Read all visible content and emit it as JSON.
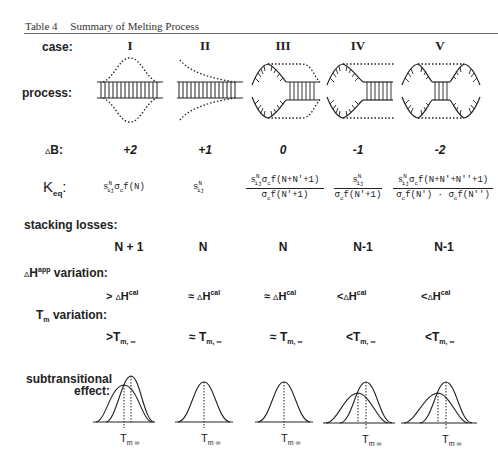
{
  "table": {
    "number": "Table 4",
    "title": "Summary of Melting Process"
  },
  "row_labels": {
    "case": "case:",
    "process": "process:",
    "delta_b": "B:",
    "delta_symbol": "Δ",
    "keq_main": "K",
    "keq_sub": "eq",
    "keq_colon": ":",
    "stacking_losses": "stacking losses:",
    "dh_variation_delta": "Δ",
    "dh_variation_H": "H",
    "dh_variation_sup": "app",
    "dh_variation_rest": " variation:",
    "tm_variation_T": "T",
    "tm_variation_sub": "m",
    "tm_variation_rest": " variation:",
    "subtransitional_line1": "subtransitional",
    "subtransitional_line2": "effect:"
  },
  "cases": [
    {
      "numeral": "I",
      "delta_b": "+2",
      "keq": {
        "type": "simple",
        "text": "s^N_ij σ_c f(N)",
        "s": "s",
        "sup": "N",
        "sub": "ij",
        "sigma": "σ",
        "sigma_sub": "c",
        "tail": "f(N)"
      },
      "stacking_losses": "N + 1",
      "dh_op": ">",
      "dh": {
        "delta": "Δ",
        "H": "H",
        "sup": "cal"
      },
      "tm_op": ">",
      "tm": {
        "T": "T",
        "sub": "m, ∞"
      },
      "subtransitional_label": {
        "T": "T",
        "sub": "m ∞"
      }
    },
    {
      "numeral": "II",
      "delta_b": "+1",
      "keq": {
        "type": "simple",
        "text": "s^N_ij",
        "s": "s",
        "sup": "N",
        "sub": "ij"
      },
      "stacking_losses": "N",
      "dh_op": "≈",
      "dh": {
        "delta": "Δ",
        "H": "H",
        "sup": "cal"
      },
      "tm_op": "≈",
      "tm": {
        "T": "T",
        "sub": "m, ∞"
      },
      "subtransitional_label": {
        "T": "T",
        "sub": "m ∞"
      }
    },
    {
      "numeral": "III",
      "delta_b": "0",
      "keq": {
        "type": "fraction",
        "numerator": "s^N_ij σ_c f(N+N'+1)",
        "denominator": "σ_c f(N'+1)",
        "num_tail": "f(N+N'+1)",
        "den_tail": "f(N'+1)"
      },
      "stacking_losses": "N",
      "dh_op": "≈",
      "dh": {
        "delta": "Δ",
        "H": "H",
        "sup": "cal"
      },
      "tm_op": "≈",
      "tm": {
        "T": "T",
        "sub": "m, ∞"
      },
      "subtransitional_label": {
        "T": "T",
        "sub": "m ∞"
      }
    },
    {
      "numeral": "IV",
      "delta_b": "-1",
      "keq": {
        "type": "fraction",
        "numerator": "s^N_ij",
        "denominator": "σ_c f(N'+1)",
        "den_tail": "f(N'+1)"
      },
      "stacking_losses": "N-1",
      "dh_op": "<",
      "dh": {
        "delta": "Δ",
        "H": "H",
        "sup": "cal"
      },
      "tm_op": "<",
      "tm": {
        "T": "T",
        "sub": "m, ∞"
      },
      "subtransitional_label": {
        "T": "T",
        "sub": "m ∞"
      }
    },
    {
      "numeral": "V",
      "delta_b": "-2",
      "keq": {
        "type": "fraction",
        "numerator": "s^N_ij σ_c f(N+N'+N''+1)",
        "denominator": "σ_c f(N') · σ_c f(N'')",
        "num_tail": "f(N+N'+N''+1)",
        "den_a": "f(N')",
        "den_dot": "·",
        "den_b": "f(N'')"
      },
      "stacking_losses": "N-1",
      "dh_op": "<",
      "dh": {
        "delta": "Δ",
        "H": "H",
        "sup": "cal"
      },
      "tm_op": "<",
      "tm": {
        "T": "T",
        "sub": "m, ∞"
      },
      "subtransitional_label": {
        "T": "T",
        "sub": "m ∞"
      }
    }
  ],
  "colors": {
    "ink": "#1a1a1a",
    "rule": "#666666",
    "background": "#ffffff"
  }
}
